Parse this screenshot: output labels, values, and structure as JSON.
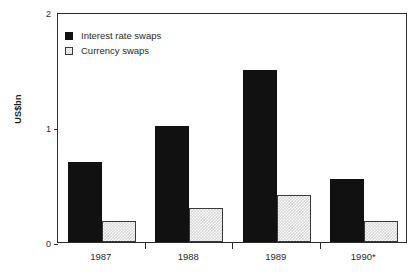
{
  "chart_data": {
    "type": "bar",
    "title": "",
    "subtitle": "",
    "xlabel": "",
    "ylabel": "US$bn",
    "categories": [
      "1987",
      "1988",
      "1989",
      "1990*"
    ],
    "series": [
      {
        "name": "Interest rate swaps",
        "values": [
          0.7,
          1.01,
          1.5,
          0.55
        ],
        "color": "#111111",
        "fill": "solid-black"
      },
      {
        "name": "Currency swaps",
        "values": [
          0.18,
          0.3,
          0.41,
          0.18
        ],
        "color": "#d8d8d8",
        "fill": "light-gray-checker"
      }
    ],
    "ylim": [
      0,
      2
    ],
    "yticks": [
      0,
      1,
      2
    ],
    "ytick_labels": [
      "0",
      "1",
      "2"
    ],
    "grid": false,
    "legend_position": "top-left",
    "annotations": [
      "* denotes provisional or partial-year data"
    ]
  },
  "axis": {
    "y_title": "US$bn",
    "y_ticks": [
      {
        "label": "2",
        "value": 2
      },
      {
        "label": "1",
        "value": 1
      },
      {
        "label": "0",
        "value": 0
      }
    ],
    "x_labels": [
      "1987",
      "1988",
      "1989",
      "1990*"
    ]
  },
  "legend": {
    "items": [
      {
        "label": "Interest rate swaps",
        "swatch": "solid-black-square-icon"
      },
      {
        "label": "Currency swaps",
        "swatch": "light-checkered-square-icon"
      }
    ]
  }
}
